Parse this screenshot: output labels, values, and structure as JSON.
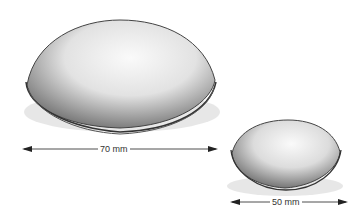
{
  "figure": {
    "large_dome": {
      "label": "70 mm"
    },
    "small_dome": {
      "label": "50 mm"
    }
  }
}
